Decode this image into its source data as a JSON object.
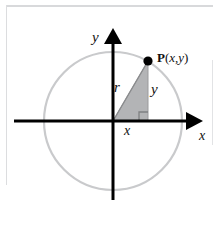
{
  "figure": {
    "kind": "unit-circle-right-triangle-diagram",
    "labels": {
      "y_axis": "y",
      "x_axis": "x",
      "radius": "r",
      "vertical_leg": "y",
      "horizontal_leg": "x",
      "point_name": "P",
      "point_open_paren": "(",
      "point_coord_x": "x",
      "point_comma": ",",
      "point_coord_y": "y",
      "point_close_paren": ")"
    },
    "colors": {
      "axis": "#000000",
      "circle": "#c9cacc",
      "triangle_fill": "#b3b4b6",
      "triangle_edge": "#8a8b8d",
      "frame_rule": "#d8d9db",
      "point_dot": "#000000",
      "background": "#ffffff"
    },
    "geometry": {
      "origin_x": 113,
      "origin_y": 121,
      "circle_radius": 69,
      "point_x": 148,
      "point_y": 61,
      "x_axis_start": 14,
      "x_axis_end": 203,
      "y_axis_top": 28,
      "y_axis_bottom": 200,
      "right_angle_marker_size": 9
    }
  }
}
